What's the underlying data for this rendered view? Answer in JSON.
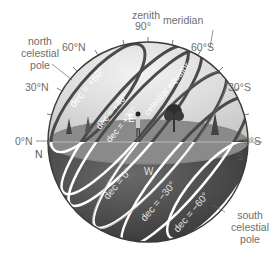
{
  "diagram": {
    "labels": {
      "zenith": "zenith",
      "zenith_angle": "90°",
      "meridian": "meridian",
      "north_celestial_pole": [
        "north",
        "celestial",
        "pole"
      ],
      "south_celestial_pole": [
        "south",
        "celestial",
        "pole"
      ],
      "celestial_equator": "celestial equator",
      "north_point": "N",
      "south_point": "S",
      "east_point": "E",
      "west_point": "W"
    },
    "altitude_ticks_left": [
      "60°N",
      "30°N",
      "0°N"
    ],
    "altitude_ticks_right": [
      "60°S",
      "30°S",
      "0°S"
    ],
    "declination_circles": [
      {
        "label": "dec = +60°",
        "side": "above"
      },
      {
        "label": "dec = +40°",
        "side": "above"
      },
      {
        "label": "dec = +30°",
        "side": "above"
      },
      {
        "label": "dec = 0°",
        "side": "below"
      },
      {
        "label": "dec = −30°",
        "side": "below"
      },
      {
        "label": "dec = −60°",
        "side": "below"
      }
    ],
    "colors": {
      "sky": "#d9d9d9",
      "ground": "#7a7a7a",
      "below_horizon": "#3c3c3c",
      "circle_above": "#4a4a4a",
      "circle_below": "#ffffff",
      "label_text": "#6e6e6e"
    }
  }
}
